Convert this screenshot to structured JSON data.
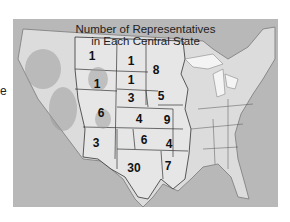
{
  "edge_text": "e",
  "map": {
    "title_line1": "Number of Representatives",
    "title_line2": "in Each Central State",
    "states": [
      {
        "name": "Montana",
        "value": "1",
        "x": 79,
        "y": 37
      },
      {
        "name": "North Dakota",
        "value": "1",
        "x": 118,
        "y": 42
      },
      {
        "name": "Minnesota",
        "value": "8",
        "x": 143,
        "y": 51
      },
      {
        "name": "Wyoming",
        "value": "1",
        "x": 84,
        "y": 65
      },
      {
        "name": "South Dakota",
        "value": "1",
        "x": 118,
        "y": 61
      },
      {
        "name": "Nebraska",
        "value": "3",
        "x": 118,
        "y": 79
      },
      {
        "name": "Iowa",
        "value": "5",
        "x": 148,
        "y": 77
      },
      {
        "name": "Colorado",
        "value": "6",
        "x": 88,
        "y": 94
      },
      {
        "name": "Kansas",
        "value": "4",
        "x": 126,
        "y": 100
      },
      {
        "name": "Missouri",
        "value": "9",
        "x": 154,
        "y": 101
      },
      {
        "name": "New Mexico",
        "value": "3",
        "x": 83,
        "y": 124
      },
      {
        "name": "Oklahoma",
        "value": "6",
        "x": 131,
        "y": 121
      },
      {
        "name": "Arkansas",
        "value": "4",
        "x": 156,
        "y": 125
      },
      {
        "name": "Texas",
        "value": "30",
        "x": 121,
        "y": 149
      },
      {
        "name": "Louisiana",
        "value": "7",
        "x": 155,
        "y": 147
      }
    ]
  }
}
